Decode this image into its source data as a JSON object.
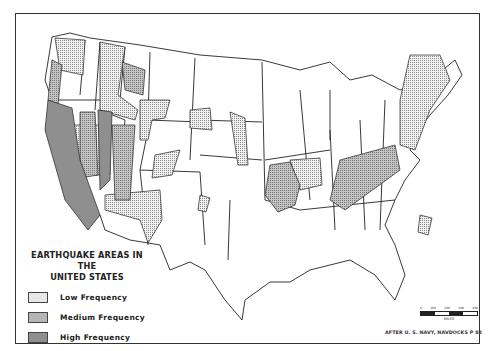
{
  "map": {
    "title_line1": "EARTHQUAKE AREAS IN THE",
    "title_line2": "UNITED STATES",
    "legend": [
      {
        "label": "Low Frequency",
        "pattern": "dotted",
        "color": "#e8e8e8"
      },
      {
        "label": "Medium Frequency",
        "pattern": "crosshatch",
        "color": "#b5b5b5"
      },
      {
        "label": "High Frequency",
        "pattern": "dark",
        "color": "#8f8f8f"
      }
    ],
    "scale": {
      "ticks": [
        "0",
        "100",
        "200",
        "300",
        "400"
      ],
      "unit": "MILES"
    },
    "credit": "AFTER U. S. NAVY, NAVDOCKS P 88"
  }
}
